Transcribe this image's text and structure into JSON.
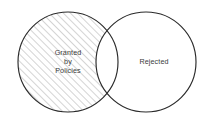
{
  "figure": {
    "type": "venn-diagram",
    "title": "",
    "background_color": "#ffffff",
    "outline_color": "#2b2b2b",
    "hatch_color": "#9a9a9a",
    "text_color": "#3a3a3a",
    "sets": [
      {
        "id": "granted",
        "name": "granted-by-policies-set",
        "label_lines": [
          "Granted",
          "by",
          "Policies"
        ],
        "label_line_1": "Granted",
        "label_line_2": "by",
        "label_line_3": "Policies",
        "fill_style": "diagonal-hatch",
        "fill_color": "#ffffff",
        "center_x": 68,
        "center_y": 62,
        "radius": 50,
        "label_x": 68,
        "label_y": 55
      },
      {
        "id": "rejected",
        "name": "rejected-set",
        "label_lines": [
          "Rejected"
        ],
        "label_line_1": "Rejected",
        "fill_style": "solid",
        "fill_color": "#ffffff",
        "center_x": 146,
        "center_y": 62,
        "radius": 50,
        "label_x": 154,
        "label_y": 64
      }
    ],
    "intersection": {
      "name": "overlap-region",
      "fill_style": "solid",
      "fill_color": "#ffffff",
      "label": ""
    }
  }
}
